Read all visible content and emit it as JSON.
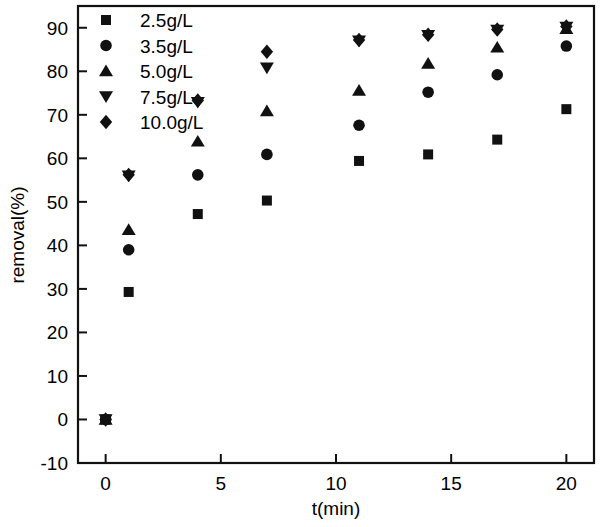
{
  "chart_data": {
    "type": "scatter",
    "title": "",
    "xlabel": "t(min)",
    "ylabel": "removal(%)",
    "xlim": [
      -1.2,
      21.2
    ],
    "ylim": [
      -10,
      95
    ],
    "xticks": [
      0,
      5,
      10,
      15,
      20
    ],
    "yticks": [
      -10,
      0,
      10,
      20,
      30,
      40,
      50,
      60,
      70,
      80,
      90
    ],
    "grid": false,
    "legend_position": "top-left",
    "x": [
      0,
      1,
      4,
      7,
      11,
      14,
      17,
      20
    ],
    "series": [
      {
        "name": "2.5g/L",
        "marker": "square",
        "color": "#111111",
        "values": [
          0,
          29.3,
          47.2,
          50.3,
          59.4,
          60.9,
          64.3,
          71.3
        ]
      },
      {
        "name": "3.5g/L",
        "marker": "circle",
        "color": "#111111",
        "values": [
          0,
          39.0,
          56.2,
          60.9,
          67.6,
          75.2,
          79.2,
          85.8
        ]
      },
      {
        "name": "5.0g/L",
        "marker": "triangle-up",
        "color": "#111111",
        "values": [
          0,
          43.6,
          63.9,
          70.9,
          75.6,
          81.8,
          85.5,
          89.8
        ]
      },
      {
        "name": "7.5g/L",
        "marker": "triangle-down",
        "color": "#111111",
        "values": [
          0,
          56.0,
          72.9,
          80.8,
          87.0,
          88.3,
          89.5,
          90.2
        ]
      },
      {
        "name": "10.0g/L",
        "marker": "diamond",
        "color": "#111111",
        "values": [
          0,
          56.2,
          73.3,
          84.5,
          87.2,
          88.4,
          89.6,
          90.3
        ]
      }
    ]
  },
  "axes": {
    "x_tick_labels": [
      "0",
      "5",
      "10",
      "15",
      "20"
    ],
    "y_tick_labels": [
      "-10",
      "0",
      "10",
      "20",
      "30",
      "40",
      "50",
      "60",
      "70",
      "80",
      "90"
    ],
    "x_axis_title": "t(min)",
    "y_axis_title": "removal(%)"
  },
  "legend": {
    "items": [
      {
        "label": "2.5g/L",
        "marker": "square"
      },
      {
        "label": "3.5g/L",
        "marker": "circle"
      },
      {
        "label": "5.0g/L",
        "marker": "triangle-up"
      },
      {
        "label": "7.5g/L",
        "marker": "triangle-down"
      },
      {
        "label": "10.0g/L",
        "marker": "diamond"
      }
    ]
  }
}
